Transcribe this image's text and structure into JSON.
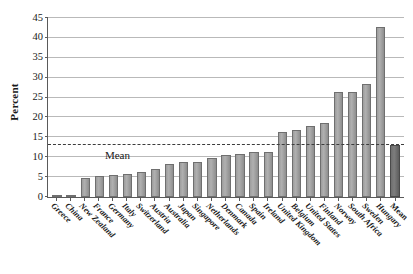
{
  "chart_data": {
    "type": "bar",
    "title": "",
    "xlabel": "",
    "ylabel": "Percent",
    "ylim": [
      0,
      45
    ],
    "ytick_step": 5,
    "yticks": [
      0,
      5,
      10,
      15,
      20,
      25,
      30,
      35,
      40,
      45
    ],
    "grid": true,
    "legend": "none",
    "categories": [
      "Greece",
      "China",
      "New Zealand",
      "France",
      "Germany",
      "Italy",
      "Switzerland",
      "Austria",
      "Australia",
      "Japan",
      "Singapore",
      "Netherlands",
      "Denmark",
      "Canada",
      "Spain",
      "Ireland",
      "United Kingdom",
      "Belgium",
      "United States",
      "Finland",
      "Norway",
      "South Africa",
      "Sweden",
      "Hungary",
      "Mean"
    ],
    "values": [
      0.3,
      0.4,
      4.7,
      5.2,
      5.6,
      5.9,
      6.4,
      7.1,
      8.4,
      8.8,
      8.9,
      9.8,
      10.5,
      10.8,
      11.2,
      11.3,
      16.4,
      16.8,
      17.9,
      18.7,
      26.5,
      26.5,
      28.5,
      42.8,
      13.2
    ],
    "annotations": [
      {
        "name": "mean-line",
        "label": "Mean",
        "value": 13.2,
        "style": "dashed"
      }
    ],
    "colors": {
      "bar_fill": "#a8a8a8",
      "bar_edge": "#6f6f6f",
      "mean_bar_fill": "#757575",
      "mean_line": "#3c3c3c",
      "grid": "#b9b9b9",
      "axis": "#5a5a5a",
      "background": "#ffffff",
      "text": "#1a1a1a"
    }
  }
}
